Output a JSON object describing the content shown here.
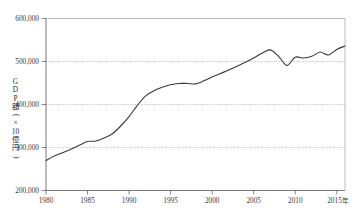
{
  "chart_data": {
    "type": "line",
    "title": "",
    "subtitle": "",
    "xlabel": "年",
    "ylabel": "GDP額(×10億円)",
    "ylabel_chars": [
      "G",
      "D",
      "P",
      "額",
      "(",
      "×",
      "10",
      "億",
      "円",
      ")"
    ],
    "xlim": [
      1980,
      2016
    ],
    "ylim": [
      200000,
      600000
    ],
    "grid": true,
    "grid_style": "dotted-horizontal",
    "legend": null,
    "legend_position": "none",
    "y_ticks": [
      200000,
      300000,
      400000,
      500000,
      600000
    ],
    "y_tick_labels": [
      "200,000",
      "300,000",
      "400,000",
      "500,000",
      "600,000"
    ],
    "x_ticks": [
      1980,
      1985,
      1990,
      1995,
      2000,
      2005,
      2010,
      2015
    ],
    "x_tick_labels": [
      "1980",
      "1985",
      "1990",
      "1995",
      "2000",
      "2005",
      "2010",
      "2015"
    ],
    "x_axis_unit_suffix": "年",
    "series": [
      {
        "name": "GDP額",
        "color": "#3a3a3a",
        "line_width": 1.1,
        "x": [
          1980,
          1981,
          1982,
          1983,
          1984,
          1985,
          1986,
          1987,
          1988,
          1989,
          1990,
          1991,
          1992,
          1993,
          1994,
          1995,
          1996,
          1997,
          1998,
          1999,
          2000,
          2001,
          2002,
          2003,
          2004,
          2005,
          2006,
          2007,
          2008,
          2009,
          2010,
          2011,
          2012,
          2013,
          2014,
          2015,
          2016
        ],
        "values": [
          270000,
          280000,
          288000,
          296000,
          305000,
          314000,
          315000,
          322000,
          332000,
          350000,
          372000,
          398000,
          420000,
          432000,
          440000,
          446000,
          449000,
          449000,
          448000,
          455000,
          464000,
          472000,
          480000,
          489000,
          498000,
          508000,
          519000,
          527000,
          512000,
          491000,
          510000,
          508000,
          512000,
          522000,
          515000,
          528000,
          536000
        ]
      }
    ]
  }
}
